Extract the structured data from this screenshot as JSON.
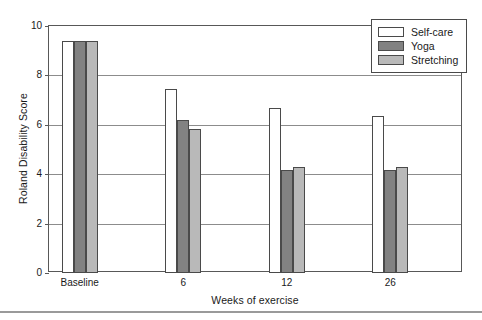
{
  "chart_data": {
    "type": "bar",
    "title": "",
    "xlabel": "Weeks of exercise",
    "ylabel": "Roland Disability Score",
    "categories": [
      "Baseline",
      "6",
      "12",
      "26"
    ],
    "series": [
      {
        "name": "Self-care",
        "color": "#ffffff",
        "values": [
          9.4,
          7.45,
          6.7,
          6.35
        ]
      },
      {
        "name": "Yoga",
        "color": "#828282",
        "values": [
          9.4,
          6.2,
          4.15,
          4.15
        ]
      },
      {
        "name": "Stretching",
        "color": "#b9b9b9",
        "values": [
          9.4,
          5.85,
          4.3,
          4.3
        ]
      }
    ],
    "ylim": [
      0,
      10
    ],
    "yticks": [
      0,
      2,
      4,
      6,
      8,
      10
    ],
    "ytick_labels": [
      "0",
      "2",
      "4",
      "6",
      "8",
      "10"
    ],
    "grid": true,
    "legend_position": "top-right",
    "legend_entries": [
      "Self-care",
      "Yoga",
      "Stretching"
    ]
  }
}
